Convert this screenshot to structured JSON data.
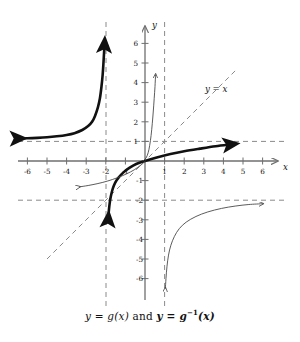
{
  "caption": {
    "prefix": "y = g(x)",
    "conjunction": "and",
    "suffix_base": "y = g",
    "suffix_exp": "−1",
    "suffix_tail": "(x)",
    "full_text": "y = g(x) and y = g−1(x)"
  },
  "axes": {
    "x_label": "x",
    "y_label": "y",
    "x_ticks": [
      "-6",
      "-5",
      "-4",
      "-3",
      "-2",
      "-1",
      "1",
      "2",
      "3",
      "4",
      "5",
      "6"
    ],
    "y_ticks": [
      "6",
      "5",
      "4",
      "3",
      "2",
      "1",
      "-1",
      "-2",
      "-3",
      "-4",
      "-5",
      "-6"
    ],
    "xlim": [
      -7.4,
      7.4
    ],
    "ylim": [
      -7.2,
      7.3
    ],
    "grid": false,
    "axis_color": "#6f6f6f",
    "origin_px": [
      145,
      161
    ],
    "unit_px": 19.6
  },
  "labels": {
    "identity_line": "y = x"
  },
  "colors": {
    "curve_bold": "#111111",
    "curve_thin": "#4a4a4a",
    "dashed": "#8a8a8a",
    "axis": "#6f6f6f",
    "text": "#111111",
    "background": "#ffffff"
  },
  "chart_data": {
    "type": "line",
    "xlabel": "x",
    "ylabel": "y",
    "xlim": [
      -7.4,
      7.4
    ],
    "ylim": [
      -7.2,
      7.3
    ],
    "grid": false,
    "legend": "none",
    "annotations": [
      {
        "text": "y = x",
        "x": 4.0,
        "y": 3.05,
        "style": "italic"
      },
      {
        "text": "y = g(x) and y = g−1(x)",
        "x": 0,
        "y": -7.9,
        "style": "caption"
      }
    ],
    "asymptotes": [
      {
        "kind": "vertical",
        "value": -2,
        "style": "dashed"
      },
      {
        "kind": "vertical",
        "value": 1,
        "style": "dashed"
      },
      {
        "kind": "horizontal",
        "value": 1,
        "style": "dashed"
      },
      {
        "kind": "horizontal",
        "value": -2,
        "style": "dashed"
      }
    ],
    "reference_lines": [
      {
        "name": "y = x",
        "kind": "diagonal",
        "slope": 1,
        "intercept": 0,
        "style": "dashed",
        "x_from": -5.0,
        "x_to": 4.6
      }
    ],
    "series": [
      {
        "name": "g(x) bold exponential (upper left)",
        "emphasis": "bold",
        "arrow_start": true,
        "arrow_end": true,
        "points": [
          [
            -6.5,
            1.15
          ],
          [
            -6.0,
            1.16
          ],
          [
            -5.5,
            1.18
          ],
          [
            -5.0,
            1.21
          ],
          [
            -4.5,
            1.26
          ],
          [
            -4.0,
            1.33
          ],
          [
            -3.6,
            1.42
          ],
          [
            -3.2,
            1.58
          ],
          [
            -2.9,
            1.78
          ],
          [
            -2.7,
            2.0
          ],
          [
            -2.55,
            2.3
          ],
          [
            -2.4,
            2.75
          ],
          [
            -2.3,
            3.2
          ],
          [
            -2.22,
            3.8
          ],
          [
            -2.16,
            4.4
          ],
          [
            -2.12,
            5.0
          ],
          [
            -2.09,
            5.5
          ],
          [
            -2.07,
            5.9
          ]
        ]
      },
      {
        "name": "g inverse bold logarithmic (through origin)",
        "emphasis": "bold",
        "arrow_start": true,
        "arrow_end": true,
        "points": [
          [
            -1.88,
            -3.0
          ],
          [
            -1.85,
            -2.6
          ],
          [
            -1.82,
            -2.3
          ],
          [
            -1.78,
            -2.0
          ],
          [
            -1.72,
            -1.7
          ],
          [
            -1.64,
            -1.4
          ],
          [
            -1.52,
            -1.1
          ],
          [
            -1.35,
            -0.85
          ],
          [
            -1.1,
            -0.58
          ],
          [
            -0.8,
            -0.35
          ],
          [
            -0.45,
            -0.15
          ],
          [
            0.0,
            0.0
          ],
          [
            0.6,
            0.18
          ],
          [
            1.3,
            0.36
          ],
          [
            2.0,
            0.5
          ],
          [
            2.8,
            0.63
          ],
          [
            3.6,
            0.75
          ],
          [
            4.35,
            0.84
          ]
        ]
      },
      {
        "name": "thin steep exponential (near y-axis)",
        "emphasis": "thin",
        "arrow_start": false,
        "arrow_end": true,
        "points": [
          [
            -0.1,
            0.0
          ],
          [
            0.05,
            0.15
          ],
          [
            0.16,
            0.42
          ],
          [
            0.24,
            0.8
          ],
          [
            0.31,
            1.3
          ],
          [
            0.37,
            1.9
          ],
          [
            0.42,
            2.5
          ],
          [
            0.47,
            3.2
          ],
          [
            0.51,
            3.8
          ],
          [
            0.54,
            4.4
          ]
        ]
      },
      {
        "name": "thin logarithmic (lower left)",
        "emphasis": "thin",
        "arrow_start": true,
        "arrow_end": false,
        "points": [
          [
            -3.35,
            -1.32
          ],
          [
            -2.9,
            -1.25
          ],
          [
            -2.4,
            -1.15
          ],
          [
            -1.9,
            -1.02
          ],
          [
            -1.4,
            -0.85
          ],
          [
            -0.95,
            -0.66
          ],
          [
            -0.55,
            -0.45
          ],
          [
            -0.2,
            -0.2
          ],
          [
            0.02,
            0.0
          ]
        ]
      },
      {
        "name": "thin logarithmic lower right (asymptotes x=1, y=-2)",
        "emphasis": "thin",
        "arrow_start": true,
        "arrow_end": true,
        "points": [
          [
            1.04,
            -6.5
          ],
          [
            1.07,
            -6.0
          ],
          [
            1.12,
            -5.4
          ],
          [
            1.2,
            -4.8
          ],
          [
            1.32,
            -4.3
          ],
          [
            1.5,
            -3.85
          ],
          [
            1.75,
            -3.45
          ],
          [
            2.1,
            -3.12
          ],
          [
            2.6,
            -2.83
          ],
          [
            3.2,
            -2.6
          ],
          [
            3.9,
            -2.42
          ],
          [
            4.6,
            -2.3
          ],
          [
            5.3,
            -2.22
          ],
          [
            6.0,
            -2.18
          ]
        ]
      }
    ]
  }
}
